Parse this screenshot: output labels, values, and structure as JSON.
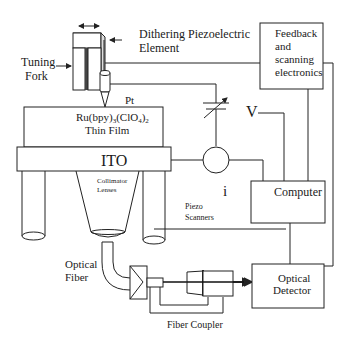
{
  "diagram": {
    "labels": {
      "dithering_line1": "Dithering Piezoelectric",
      "dithering_line2": "Element",
      "tuning_fork_line1": "Tuning",
      "tuning_fork_line2": "Fork",
      "pt": "Pt",
      "film_line1": "Ru(bpy)",
      "film_sub1": "3",
      "film_mid": "(ClO",
      "film_sub2": "4",
      "film_end": ")",
      "film_sub3": "2",
      "film_line2": "Thin Film",
      "ito": "ITO",
      "collimator_line1": "Collimator",
      "collimator_line2": "Lenses",
      "v": "V",
      "i": "i",
      "piezo_line1": "Piezo",
      "piezo_line2": "Scanners",
      "optical_fiber_line1": "Optical",
      "optical_fiber_line2": "Fiber",
      "fiber_coupler": "Fiber Coupler"
    },
    "boxes": {
      "feedback_line1": "Feedback",
      "feedback_line2": "and",
      "feedback_line3": "scanning",
      "feedback_line4": "electronics",
      "computer": "Computer",
      "detector_line1": "Optical",
      "detector_line2": "Detector"
    }
  }
}
